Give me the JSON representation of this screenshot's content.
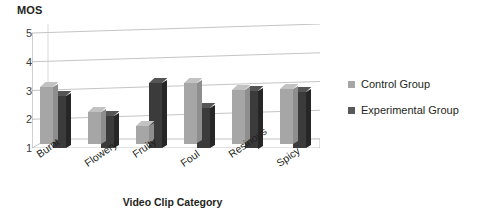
{
  "chart_data": {
    "type": "bar",
    "title": "",
    "ylabel": "MOS",
    "xlabel": "Video Clip Category",
    "categories": [
      "Burnt",
      "Flowery",
      "Fruity",
      "Foul",
      "Resinous",
      "Spicy"
    ],
    "yticks": [
      1,
      2,
      3,
      4,
      5
    ],
    "ylim": [
      1,
      5
    ],
    "grid": true,
    "legend_position": "right",
    "style": "3d-column",
    "series": [
      {
        "name": "Control Group",
        "color": "#a6a6a6",
        "values": [
          2.95,
          2.1,
          1.6,
          3.1,
          2.85,
          2.9
        ]
      },
      {
        "name": "Experimental Group",
        "color": "#3b3b3b",
        "values": [
          2.8,
          2.1,
          3.25,
          2.4,
          3.0,
          2.95
        ]
      }
    ]
  },
  "legend": {
    "items": [
      {
        "label": "Control Group",
        "swatch": "#a6a6a6"
      },
      {
        "label": "Experimental Group",
        "swatch": "#595959"
      }
    ]
  }
}
